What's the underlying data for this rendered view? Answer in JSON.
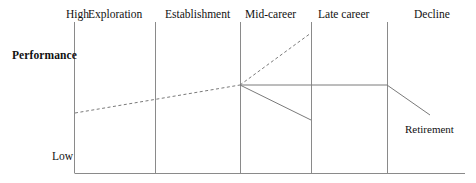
{
  "figure": {
    "axis_labels": {
      "high": "High",
      "low": "Low",
      "performance": "Performance"
    },
    "stages": [
      {
        "label": "Exploration",
        "x": 88
      },
      {
        "label": "Establishment",
        "x": 165
      },
      {
        "label": "Mid-career",
        "x": 245
      },
      {
        "label": "Late career",
        "x": 318
      },
      {
        "label": "Decline",
        "x": 414
      }
    ],
    "annotations": [
      {
        "label": "Retirement",
        "x": 405,
        "y": 124
      }
    ],
    "colors": {
      "line": "#7a7a7a",
      "axis": "#8a8a8a",
      "text": "#111111",
      "background": "#ffffff"
    }
  },
  "chart_data": {
    "type": "line",
    "title": "",
    "xlabel": "",
    "ylabel": "Performance",
    "ytick_labels": [
      "High",
      "Low"
    ],
    "ylim_labels": {
      "top": "High",
      "bottom": "Low"
    },
    "grid": false,
    "legend": null,
    "categories": [
      "Exploration",
      "Establishment",
      "Mid-career",
      "Late career",
      "Decline"
    ],
    "category_boundaries_px": [
      74,
      155,
      240,
      311,
      387,
      465
    ],
    "axis": {
      "y_axis_x_px": 74,
      "y_axis_top_px": 22,
      "y_axis_bottom_px": 173,
      "x_axis_y_px": 173,
      "x_axis_right_px": 465
    },
    "dividers_px": [
      74,
      155,
      240,
      311,
      387
    ],
    "series": [
      {
        "name": "Early career growth",
        "style": "dashed",
        "points": [
          [
            75,
            113
          ],
          [
            240,
            85
          ]
        ]
      },
      {
        "name": "Continued growth",
        "style": "dashed",
        "points": [
          [
            240,
            85
          ],
          [
            311,
            33
          ]
        ]
      },
      {
        "name": "Maintenance / plateau then decline",
        "style": "solid",
        "points": [
          [
            240,
            85
          ],
          [
            387,
            85
          ],
          [
            430,
            115
          ]
        ]
      },
      {
        "name": "Early decline",
        "style": "solid",
        "points": [
          [
            240,
            85
          ],
          [
            311,
            120
          ]
        ]
      }
    ],
    "annotations": [
      {
        "text": "Retirement",
        "x_px": 405,
        "y_px": 130
      }
    ]
  }
}
